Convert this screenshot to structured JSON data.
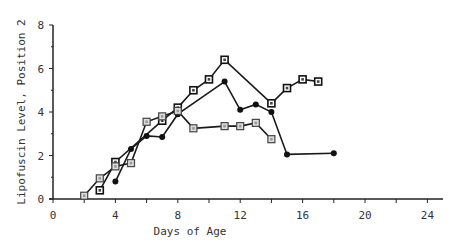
{
  "chart_data": {
    "type": "line",
    "title": "",
    "xlabel": "Days of Age",
    "ylabel": "Lipofuscin Level, Position 2",
    "xlim": [
      0,
      25
    ],
    "ylim": [
      0,
      8
    ],
    "xticks": [
      0,
      4,
      8,
      12,
      16,
      20,
      24
    ],
    "yticks": [
      0,
      2,
      4,
      6,
      8
    ],
    "grid": false,
    "legend": null,
    "series": [
      {
        "name": "Series A (dark squares)",
        "marker": "square-dark",
        "x": [
          3,
          4,
          7,
          8,
          9,
          10,
          11,
          14,
          15,
          16,
          17
        ],
        "y": [
          0.4,
          1.7,
          3.6,
          4.2,
          5.0,
          5.5,
          6.4,
          4.4,
          5.1,
          5.5,
          5.4
        ]
      },
      {
        "name": "Series B (filled diamonds)",
        "marker": "diamond",
        "x": [
          4,
          5,
          6,
          7,
          8,
          11,
          12,
          13,
          14,
          15,
          18
        ],
        "y": [
          0.8,
          2.3,
          2.9,
          2.85,
          3.9,
          5.4,
          4.1,
          4.35,
          4.0,
          2.05,
          2.1
        ]
      },
      {
        "name": "Series C (light squares)",
        "marker": "square-light",
        "x": [
          2,
          3,
          4,
          5,
          6,
          7,
          8,
          9,
          11,
          12,
          13,
          14
        ],
        "y": [
          0.15,
          0.95,
          1.5,
          1.65,
          3.55,
          3.8,
          4.05,
          3.25,
          3.35,
          3.35,
          3.5,
          2.75
        ]
      }
    ]
  }
}
